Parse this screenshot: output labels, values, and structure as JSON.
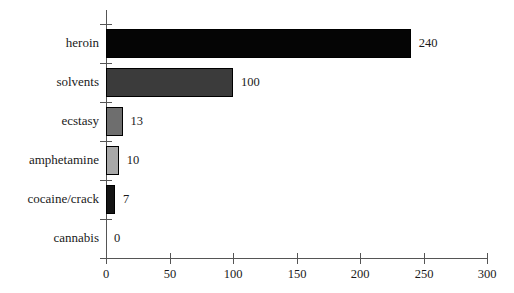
{
  "chart_data": {
    "type": "bar",
    "orientation": "horizontal",
    "title": "",
    "xlabel": "",
    "ylabel": "",
    "xlim": [
      0,
      300
    ],
    "xticks": [
      0,
      50,
      100,
      150,
      200,
      250,
      300
    ],
    "xtick_labels": [
      "0",
      "50",
      "100",
      "150",
      "200",
      "250",
      "300"
    ],
    "grid": false,
    "legend": null,
    "categories": [
      "heroin",
      "solvents",
      "ecstasy",
      "amphetamine",
      "cocaine/crack",
      "cannabis"
    ],
    "values": [
      240,
      100,
      13,
      10,
      7,
      0
    ],
    "value_labels": [
      "240",
      "100",
      "13",
      "10",
      "7",
      "0"
    ],
    "bar_colors": [
      "#050505",
      "#3b3b3b",
      "#6e6e6e",
      "#a8a8a8",
      "#141414",
      "#ffffff"
    ],
    "bars": [
      {
        "category": "heroin",
        "value": 240,
        "label": "240",
        "color": "#050505"
      },
      {
        "category": "solvents",
        "value": 100,
        "label": "100",
        "color": "#3b3b3b"
      },
      {
        "category": "ecstasy",
        "value": 13,
        "label": "13",
        "color": "#6e6e6e"
      },
      {
        "category": "amphetamine",
        "value": 10,
        "label": "10",
        "color": "#a8a8a8"
      },
      {
        "category": "cocaine/crack",
        "value": 7,
        "label": "7",
        "color": "#141414"
      },
      {
        "category": "cannabis",
        "value": 0,
        "label": "0",
        "color": "#ffffff"
      }
    ],
    "axis_color": "#555555",
    "text_color": "#1a1a1a",
    "background": "#ffffff"
  }
}
